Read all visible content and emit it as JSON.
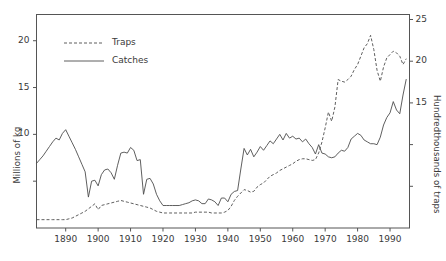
{
  "chart_data": {
    "type": "line",
    "title": "",
    "xlabel": "",
    "ylabel": "Millions of kg",
    "y2label": "Hundredthousands of traps",
    "xlim": [
      1881,
      1996
    ],
    "ylim": [
      0,
      22.8
    ],
    "y2lim": [
      0,
      25.6
    ],
    "grid": false,
    "legend_position": "upper left",
    "xticks": [
      1890,
      1900,
      1910,
      1920,
      1930,
      1940,
      1950,
      1960,
      1970,
      1980,
      1990
    ],
    "xticklabels": [
      "1890",
      "1900",
      "1910",
      "1920",
      "1930",
      "1940",
      "1950",
      "1960",
      "1970",
      "1980",
      "1990"
    ],
    "yticks": [
      5,
      10,
      15,
      20
    ],
    "yticklabels": [
      "",
      "10",
      "15",
      "20"
    ],
    "y2ticks": [
      5,
      10,
      15,
      20,
      25
    ],
    "y2ticklabels": [
      "",
      "",
      "15",
      "20",
      "25"
    ],
    "series": [
      {
        "name": "Catches",
        "axis": "left",
        "style": "solid",
        "color": "#4d4d4d",
        "units": "Millions of kg",
        "x": [
          1881,
          1882,
          1883,
          1884,
          1885,
          1886,
          1887,
          1888,
          1889,
          1890,
          1891,
          1892,
          1893,
          1894,
          1895,
          1896,
          1897,
          1898,
          1899,
          1900,
          1901,
          1902,
          1903,
          1904,
          1905,
          1906,
          1907,
          1908,
          1909,
          1910,
          1911,
          1912,
          1913,
          1914,
          1915,
          1916,
          1917,
          1918,
          1919,
          1920,
          1921,
          1922,
          1923,
          1924,
          1925,
          1926,
          1927,
          1928,
          1929,
          1930,
          1931,
          1932,
          1933,
          1934,
          1935,
          1936,
          1937,
          1938,
          1939,
          1940,
          1941,
          1942,
          1943,
          1944,
          1945,
          1946,
          1947,
          1948,
          1949,
          1950,
          1951,
          1952,
          1953,
          1954,
          1955,
          1956,
          1957,
          1958,
          1959,
          1960,
          1961,
          1962,
          1963,
          1964,
          1965,
          1966,
          1967,
          1968,
          1969,
          1970,
          1971,
          1972,
          1973,
          1974,
          1975,
          1976,
          1977,
          1978,
          1979,
          1980,
          1981,
          1982,
          1983,
          1984,
          1985,
          1986,
          1987,
          1988,
          1989,
          1990,
          1991,
          1992,
          1993,
          1994,
          1995
        ],
        "y": [
          6.9,
          7.3,
          7.7,
          8.2,
          8.7,
          9.2,
          9.6,
          9.4,
          10.1,
          10.5,
          9.8,
          9.1,
          8.4,
          7.6,
          6.8,
          6.0,
          3.3,
          5.0,
          5.1,
          4.5,
          5.7,
          6.2,
          6.3,
          5.9,
          5.2,
          6.7,
          8.0,
          8.1,
          8.0,
          8.6,
          8.3,
          7.2,
          7.3,
          3.6,
          5.2,
          5.3,
          4.7,
          3.6,
          2.9,
          2.4,
          2.4,
          2.4,
          2.4,
          2.4,
          2.4,
          2.5,
          2.6,
          2.7,
          2.9,
          3.0,
          2.9,
          2.6,
          2.6,
          3.1,
          3.0,
          2.8,
          2.4,
          3.2,
          3.2,
          2.8,
          3.6,
          3.9,
          4.0,
          6.3,
          8.5,
          7.8,
          8.4,
          7.6,
          8.1,
          8.7,
          8.3,
          8.8,
          9.3,
          9.0,
          9.5,
          10.0,
          9.4,
          10.1,
          9.6,
          9.8,
          9.5,
          9.6,
          9.2,
          9.5,
          9.0,
          8.6,
          7.9,
          8.9,
          8.0,
          7.9,
          7.6,
          7.5,
          7.6,
          8.0,
          8.3,
          8.2,
          8.6,
          9.5,
          9.8,
          10.1,
          9.9,
          9.4,
          9.2,
          9.0,
          9.0,
          8.9,
          9.7,
          11.0,
          11.8,
          12.3,
          13.5,
          12.6,
          12.2,
          14.2,
          15.9
        ]
      },
      {
        "name": "Traps",
        "axis": "right",
        "style": "dashed",
        "color": "#4d4d4d",
        "units": "Hundredthousands of traps",
        "x": [
          1881,
          1882,
          1883,
          1884,
          1885,
          1886,
          1887,
          1888,
          1889,
          1890,
          1891,
          1892,
          1893,
          1894,
          1895,
          1896,
          1897,
          1898,
          1899,
          1900,
          1901,
          1902,
          1903,
          1904,
          1905,
          1906,
          1907,
          1908,
          1909,
          1910,
          1911,
          1912,
          1913,
          1914,
          1915,
          1916,
          1917,
          1918,
          1919,
          1920,
          1921,
          1922,
          1923,
          1924,
          1925,
          1926,
          1927,
          1928,
          1929,
          1930,
          1931,
          1932,
          1933,
          1934,
          1935,
          1936,
          1937,
          1938,
          1939,
          1940,
          1941,
          1942,
          1943,
          1944,
          1945,
          1946,
          1947,
          1948,
          1949,
          1950,
          1951,
          1952,
          1953,
          1954,
          1955,
          1956,
          1957,
          1958,
          1959,
          1960,
          1961,
          1962,
          1963,
          1964,
          1965,
          1966,
          1967,
          1968,
          1969,
          1970,
          1971,
          1972,
          1973,
          1974,
          1975,
          1976,
          1977,
          1978,
          1979,
          1980,
          1981,
          1982,
          1983,
          1984,
          1985,
          1986,
          1987,
          1988,
          1989,
          1990,
          1991,
          1992,
          1993,
          1994,
          1995
        ],
        "y": [
          1.0,
          1.0,
          1.0,
          1.0,
          1.0,
          1.0,
          1.0,
          1.0,
          1.0,
          1.0,
          1.1,
          1.2,
          1.4,
          1.6,
          1.8,
          2.0,
          2.3,
          2.6,
          2.9,
          2.2,
          2.7,
          2.8,
          2.9,
          3.0,
          3.1,
          3.2,
          3.3,
          3.2,
          3.1,
          3.0,
          2.9,
          2.8,
          2.7,
          2.6,
          2.5,
          2.4,
          2.2,
          2.0,
          1.9,
          1.8,
          1.8,
          1.8,
          1.8,
          1.8,
          1.8,
          1.8,
          1.8,
          1.8,
          1.8,
          1.9,
          1.9,
          1.9,
          1.9,
          1.9,
          1.8,
          1.8,
          1.8,
          1.8,
          1.9,
          2.1,
          2.6,
          3.3,
          3.8,
          4.2,
          4.6,
          4.5,
          4.3,
          4.4,
          4.9,
          5.2,
          5.4,
          5.8,
          6.2,
          6.4,
          6.6,
          6.9,
          7.1,
          7.3,
          7.5,
          7.7,
          8.0,
          8.2,
          8.3,
          8.3,
          8.2,
          8.1,
          8.2,
          9.0,
          10.3,
          12.0,
          13.9,
          12.8,
          14.5,
          17.8,
          17.6,
          17.5,
          17.8,
          18.2,
          19.0,
          19.6,
          20.6,
          21.6,
          22.1,
          23.1,
          21.4,
          18.9,
          17.6,
          19.3,
          20.4,
          20.8,
          21.2,
          21.0,
          20.6,
          19.6,
          20.3
        ]
      }
    ],
    "legend": [
      {
        "label": "Traps",
        "style": "dashed"
      },
      {
        "label": "Catches",
        "style": "solid"
      }
    ]
  },
  "axes": {
    "left_title": "Millions of kg",
    "right_title": "Hundredthousands of traps"
  }
}
